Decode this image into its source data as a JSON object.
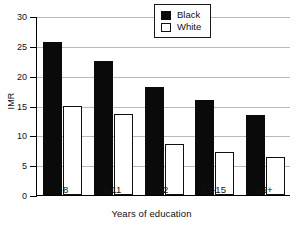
{
  "chart_data": {
    "type": "bar",
    "title": "",
    "xlabel": "Years of education",
    "ylabel": "IMR",
    "categories": [
      "0-8",
      "9-11",
      "12",
      "13-15",
      "16+"
    ],
    "series": [
      {
        "name": "Black",
        "values": [
          25.7,
          22.5,
          18.1,
          16.0,
          13.4
        ],
        "color": "#0a0a0a",
        "fill": "solid"
      },
      {
        "name": "White",
        "values": [
          15.0,
          13.5,
          8.6,
          7.2,
          6.3
        ],
        "color": "#ffffff",
        "fill": "outline"
      }
    ],
    "ylim": [
      0,
      30
    ],
    "yticks": [
      0,
      5,
      10,
      15,
      20,
      25,
      30
    ],
    "grid": true,
    "grid_axis": "y",
    "legend_position": "top-right",
    "legend_entries": [
      "Black",
      "White"
    ]
  },
  "axis": {
    "y_tick_labels": [
      "0",
      "5",
      "10",
      "15",
      "20",
      "25",
      "30"
    ],
    "x_tick_labels": [
      "0-8",
      "9-11",
      "12",
      "13-15",
      "16+"
    ],
    "y_title": "IMR",
    "x_title": "Years of education"
  },
  "legend": {
    "items": [
      {
        "label": "Black",
        "swatch": "filled-square"
      },
      {
        "label": "White",
        "swatch": "outline-square"
      }
    ]
  }
}
